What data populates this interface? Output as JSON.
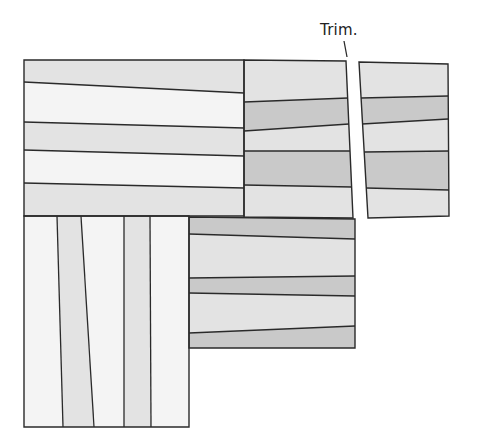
{
  "annotation": {
    "text": "Trim.",
    "x": 320,
    "y": 21,
    "leader": [
      [
        344,
        41
      ],
      [
        347,
        57
      ]
    ]
  },
  "colors": {
    "white": "#f4f4f4",
    "light": "#e3e3e3",
    "dark": "#c9c9c9",
    "line": "#2a2a2a"
  },
  "blocks": [
    {
      "name": "top-left-block",
      "outline": [
        [
          24,
          60
        ],
        [
          244,
          60
        ],
        [
          244,
          216
        ],
        [
          24,
          216
        ]
      ],
      "orientation": "horizontal",
      "strips": [
        {
          "shade": "light",
          "poly": [
            [
              24,
              60
            ],
            [
              244,
              60
            ],
            [
              244,
              93
            ],
            [
              24,
              82
            ]
          ]
        },
        {
          "shade": "white",
          "poly": [
            [
              24,
              82
            ],
            [
              244,
              93
            ],
            [
              244,
              128
            ],
            [
              24,
              122
            ]
          ]
        },
        {
          "shade": "light",
          "poly": [
            [
              24,
              122
            ],
            [
              244,
              128
            ],
            [
              244,
              156
            ],
            [
              24,
              150
            ]
          ]
        },
        {
          "shade": "white",
          "poly": [
            [
              24,
              150
            ],
            [
              244,
              156
            ],
            [
              244,
              188
            ],
            [
              24,
              183
            ]
          ]
        },
        {
          "shade": "light",
          "poly": [
            [
              24,
              183
            ],
            [
              244,
              188
            ],
            [
              244,
              216
            ],
            [
              24,
              216
            ]
          ]
        }
      ],
      "seams": [
        [
          [
            24,
            82
          ],
          [
            244,
            93
          ]
        ],
        [
          [
            24,
            122
          ],
          [
            244,
            128
          ]
        ],
        [
          [
            24,
            150
          ],
          [
            244,
            156
          ]
        ],
        [
          [
            24,
            183
          ],
          [
            244,
            188
          ]
        ]
      ]
    },
    {
      "name": "top-middle-block",
      "outline": [
        [
          244,
          60
        ],
        [
          346,
          61
        ],
        [
          353,
          218
        ],
        [
          244,
          217
        ]
      ],
      "orientation": "horizontal",
      "strips": [
        {
          "shade": "light",
          "poly": [
            [
              244,
              60
            ],
            [
              346,
              61
            ],
            [
              348,
              98
            ],
            [
              244,
              102
            ]
          ]
        },
        {
          "shade": "dark",
          "poly": [
            [
              244,
              102
            ],
            [
              348,
              98
            ],
            [
              349,
              124
            ],
            [
              244,
              131
            ]
          ]
        },
        {
          "shade": "light",
          "poly": [
            [
              244,
              131
            ],
            [
              349,
              124
            ],
            [
              350,
              151
            ],
            [
              244,
              151
            ]
          ]
        },
        {
          "shade": "dark",
          "poly": [
            [
              244,
              151
            ],
            [
              350,
              151
            ],
            [
              352,
              187
            ],
            [
              244,
              185
            ]
          ]
        },
        {
          "shade": "light",
          "poly": [
            [
              244,
              185
            ],
            [
              352,
              187
            ],
            [
              353,
              218
            ],
            [
              244,
              217
            ]
          ]
        }
      ],
      "seams": [
        [
          [
            244,
            102
          ],
          [
            348,
            98
          ]
        ],
        [
          [
            244,
            131
          ],
          [
            349,
            124
          ]
        ],
        [
          [
            244,
            151
          ],
          [
            350,
            151
          ]
        ],
        [
          [
            244,
            185
          ],
          [
            352,
            187
          ]
        ]
      ]
    },
    {
      "name": "trimmed-right-block",
      "outline": [
        [
          359,
          62
        ],
        [
          448,
          64
        ],
        [
          449,
          216
        ],
        [
          368,
          218
        ]
      ],
      "orientation": "horizontal",
      "strips": [
        {
          "shade": "light",
          "poly": [
            [
              359,
              62
            ],
            [
              448,
              64
            ],
            [
              448,
              96
            ],
            [
              361,
              98
            ]
          ]
        },
        {
          "shade": "dark",
          "poly": [
            [
              361,
              98
            ],
            [
              448,
              96
            ],
            [
              448,
              119
            ],
            [
              362,
              124
            ]
          ]
        },
        {
          "shade": "light",
          "poly": [
            [
              362,
              124
            ],
            [
              448,
              119
            ],
            [
              449,
              151
            ],
            [
              364,
              152
            ]
          ]
        },
        {
          "shade": "dark",
          "poly": [
            [
              364,
              152
            ],
            [
              449,
              151
            ],
            [
              449,
              190
            ],
            [
              366,
              188
            ]
          ]
        },
        {
          "shade": "light",
          "poly": [
            [
              366,
              188
            ],
            [
              449,
              190
            ],
            [
              449,
              216
            ],
            [
              368,
              218
            ]
          ]
        }
      ],
      "seams": [
        [
          [
            361,
            98
          ],
          [
            448,
            96
          ]
        ],
        [
          [
            362,
            124
          ],
          [
            448,
            119
          ]
        ],
        [
          [
            364,
            152
          ],
          [
            449,
            151
          ]
        ],
        [
          [
            366,
            188
          ],
          [
            449,
            190
          ]
        ]
      ]
    },
    {
      "name": "bottom-left-block",
      "outline": [
        [
          24,
          216
        ],
        [
          189,
          216
        ],
        [
          189,
          427
        ],
        [
          24,
          427
        ]
      ],
      "orientation": "vertical",
      "strips": [
        {
          "shade": "white",
          "poly": [
            [
              24,
              216
            ],
            [
              57,
              216
            ],
            [
              63,
              427
            ],
            [
              24,
              427
            ]
          ]
        },
        {
          "shade": "light",
          "poly": [
            [
              57,
              216
            ],
            [
              81,
              216
            ],
            [
              94,
              427
            ],
            [
              63,
              427
            ]
          ]
        },
        {
          "shade": "white",
          "poly": [
            [
              81,
              216
            ],
            [
              124,
              216
            ],
            [
              124,
              427
            ],
            [
              94,
              427
            ]
          ]
        },
        {
          "shade": "light",
          "poly": [
            [
              124,
              216
            ],
            [
              150,
              216
            ],
            [
              151,
              427
            ],
            [
              124,
              427
            ]
          ]
        },
        {
          "shade": "white",
          "poly": [
            [
              150,
              216
            ],
            [
              189,
              216
            ],
            [
              189,
              427
            ],
            [
              151,
              427
            ]
          ]
        }
      ],
      "seams": [
        [
          [
            57,
            216
          ],
          [
            63,
            427
          ]
        ],
        [
          [
            81,
            216
          ],
          [
            94,
            427
          ]
        ],
        [
          [
            124,
            216
          ],
          [
            124,
            427
          ]
        ],
        [
          [
            150,
            216
          ],
          [
            151,
            427
          ]
        ]
      ]
    },
    {
      "name": "bottom-middle-block",
      "outline": [
        [
          189,
          217
        ],
        [
          355,
          219
        ],
        [
          355,
          348
        ],
        [
          189,
          348
        ]
      ],
      "orientation": "horizontal",
      "strips": [
        {
          "shade": "dark",
          "poly": [
            [
              189,
              217
            ],
            [
              355,
              219
            ],
            [
              355,
              239
            ],
            [
              189,
              234
            ]
          ]
        },
        {
          "shade": "light",
          "poly": [
            [
              189,
              234
            ],
            [
              355,
              239
            ],
            [
              355,
              276
            ],
            [
              189,
              278
            ]
          ]
        },
        {
          "shade": "dark",
          "poly": [
            [
              189,
              278
            ],
            [
              355,
              276
            ],
            [
              355,
              296
            ],
            [
              189,
              293
            ]
          ]
        },
        {
          "shade": "light",
          "poly": [
            [
              189,
              293
            ],
            [
              355,
              296
            ],
            [
              355,
              326
            ],
            [
              189,
              333
            ]
          ]
        },
        {
          "shade": "dark",
          "poly": [
            [
              189,
              333
            ],
            [
              355,
              326
            ],
            [
              355,
              348
            ],
            [
              189,
              348
            ]
          ]
        }
      ],
      "seams": [
        [
          [
            189,
            234
          ],
          [
            355,
            239
          ]
        ],
        [
          [
            189,
            278
          ],
          [
            355,
            276
          ]
        ],
        [
          [
            189,
            293
          ],
          [
            355,
            296
          ]
        ],
        [
          [
            189,
            333
          ],
          [
            355,
            326
          ]
        ]
      ]
    }
  ]
}
